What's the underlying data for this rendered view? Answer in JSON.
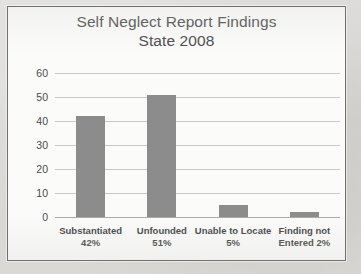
{
  "figure": {
    "title_line1": "Self Neglect Report Findings",
    "title_line2": "State 2008",
    "bar_color": "#8c8c8c",
    "grid_color": "#c8c8c8",
    "frame_border_color": "#6f6f6f",
    "page_background": "#d9d9d6",
    "plot_background": "#fbfbfa"
  },
  "chart_data": {
    "type": "bar",
    "title": "Self Neglect Report Findings State 2008",
    "xlabel": "",
    "ylabel": "",
    "ylim": [
      0,
      60
    ],
    "ytick_values": [
      0,
      10,
      20,
      30,
      40,
      50,
      60
    ],
    "ytick_labels": [
      "0",
      "10",
      "20",
      "30",
      "40",
      "50",
      "60"
    ],
    "grid": true,
    "legend": false,
    "categories": [
      "Substantiated",
      "Unfounded",
      "Unable to Locate",
      "Finding not Entered"
    ],
    "category_labels": [
      "Substantiated\n42%",
      "Unfounded\n51%",
      "Unable to Locate\n5%",
      "Finding not\nEntered 2%"
    ],
    "values": [
      42,
      51,
      5,
      2
    ],
    "value_percent_labels": [
      "42%",
      "51%",
      "5%",
      "2%"
    ]
  }
}
